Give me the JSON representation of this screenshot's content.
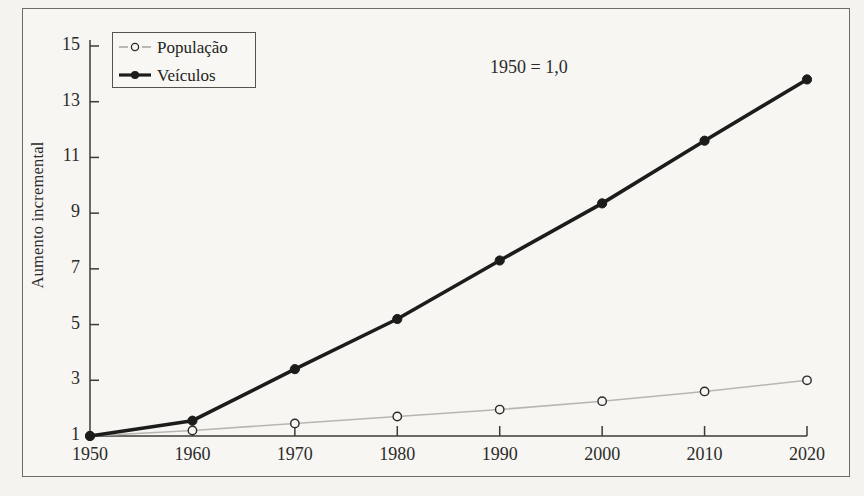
{
  "chart_data": {
    "type": "line",
    "title": "",
    "subtitle": "",
    "xlabel": "",
    "ylabel": "Aumento incremental",
    "annotation": "1950 = 1,0",
    "x": [
      1950,
      1960,
      1970,
      1980,
      1990,
      2000,
      2010,
      2020
    ],
    "xtick_labels": [
      "1950",
      "1960",
      "1970",
      "1980",
      "1990",
      "2000",
      "2010",
      "2020"
    ],
    "ytick_labels": [
      "1",
      "3",
      "5",
      "7",
      "9",
      "11",
      "13",
      "15"
    ],
    "ytick_values": [
      1,
      3,
      5,
      7,
      9,
      11,
      13,
      15
    ],
    "xlim": [
      1950,
      2020
    ],
    "ylim": [
      1,
      15
    ],
    "grid": false,
    "legend_position": "upper-left",
    "series": [
      {
        "name": "População",
        "values": [
          1.0,
          1.2,
          1.45,
          1.7,
          1.95,
          2.25,
          2.6,
          3.0
        ],
        "color": "#b8b6b2",
        "marker": "open-circle",
        "marker_fill": "#f7f6f3",
        "line_width": 1.6
      },
      {
        "name": "Veículos",
        "values": [
          1.0,
          1.55,
          3.4,
          5.2,
          7.3,
          9.35,
          11.6,
          13.8
        ],
        "color": "#1c1c1a",
        "marker": "filled-circle",
        "marker_fill": "#1c1c1a",
        "line_width": 3.6
      }
    ]
  },
  "legend": {
    "items": [
      {
        "label": "População",
        "marker": "open-circle"
      },
      {
        "label": "Veículos",
        "marker": "filled-circle"
      }
    ]
  },
  "colors": {
    "background": "#f4f3f0",
    "panel": "#f7f6f3",
    "frame": "#6e6c68",
    "axis": "#3b3b38",
    "populacao": "#b8b6b2",
    "veiculos": "#1c1c1a",
    "text": "#2b2b29"
  }
}
